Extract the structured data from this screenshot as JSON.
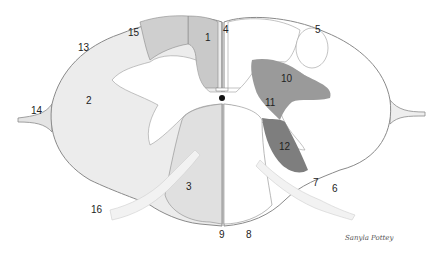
{
  "diagram": {
    "colors": {
      "background": "#ffffff",
      "outline": "#8a8a8a",
      "white_matter_left": "#ececec",
      "white_matter_right": "#ffffff",
      "tract_dark": "#9a9a9a",
      "tract_darker": "#7e7e7e",
      "tract_light": "#c9c9c9",
      "gray_matter": "#ffffff",
      "central_canal": "#111111"
    },
    "labels": [
      {
        "id": "1",
        "text": "1",
        "x": 205,
        "y": 41
      },
      {
        "id": "2",
        "text": "2",
        "x": 90,
        "y": 101
      },
      {
        "id": "3",
        "text": "3",
        "x": 189,
        "y": 187
      },
      {
        "id": "4",
        "text": "4",
        "x": 226,
        "y": 33
      },
      {
        "id": "5",
        "text": "5",
        "x": 318,
        "y": 32
      },
      {
        "id": "6",
        "text": "6",
        "x": 335,
        "y": 190
      },
      {
        "id": "7",
        "text": "7",
        "x": 316,
        "y": 184
      },
      {
        "id": "8",
        "text": "8",
        "x": 249,
        "y": 235
      },
      {
        "id": "9",
        "text": "9",
        "x": 222,
        "y": 236
      },
      {
        "id": "10",
        "text": "10",
        "x": 287,
        "y": 80
      },
      {
        "id": "11",
        "text": "11",
        "x": 271,
        "y": 104
      },
      {
        "id": "12",
        "text": "12",
        "x": 285,
        "y": 148
      },
      {
        "id": "13",
        "text": "13",
        "x": 84,
        "y": 50
      },
      {
        "id": "14",
        "text": "14",
        "x": 37,
        "y": 113
      },
      {
        "id": "15",
        "text": "15",
        "x": 134,
        "y": 35
      },
      {
        "id": "16",
        "text": "16",
        "x": 97,
        "y": 211
      }
    ],
    "signature": "Sanyla Pottey"
  }
}
